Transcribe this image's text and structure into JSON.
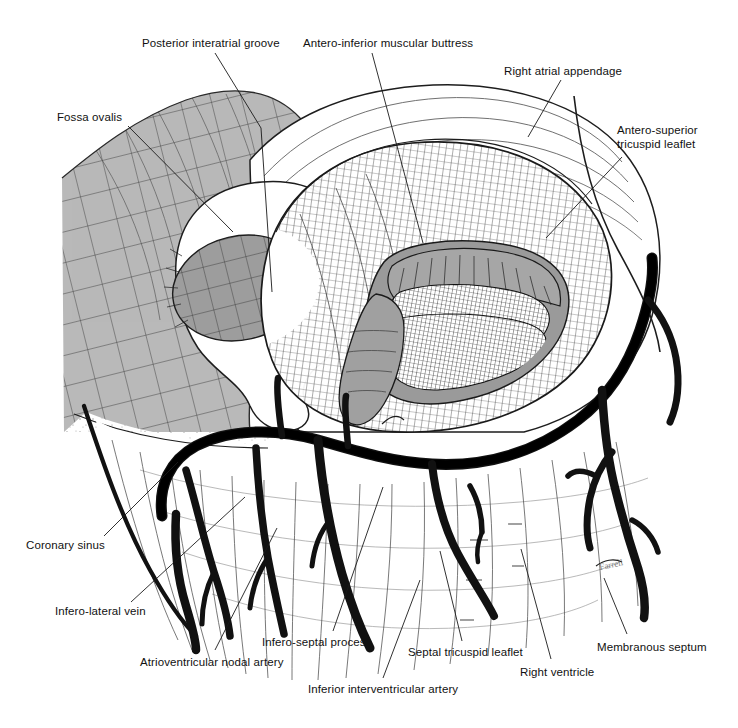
{
  "figure": {
    "width": 738,
    "height": 728,
    "background_color": "#ffffff",
    "ink_color": "#111111",
    "shaded_tone": "#b9b9b9",
    "mid_tone": "#a5a5a5",
    "vessel_color": "#111111",
    "signature": "Farrell"
  },
  "labels": [
    {
      "id": "fossa-ovalis",
      "text": "Fossa ovalis",
      "x": 57,
      "y": 110,
      "leader": [
        [
          128,
          126
        ],
        [
          233,
          232
        ]
      ]
    },
    {
      "id": "posterior-interatrial-groove",
      "text": "Posterior interatrial groove",
      "x": 142,
      "y": 36,
      "leader": [
        [
          215,
          53
        ],
        [
          261,
          128
        ],
        [
          272,
          292
        ]
      ]
    },
    {
      "id": "antero-inferior-muscular-buttress",
      "text": "Antero-inferior muscular buttress",
      "x": 303,
      "y": 36,
      "leader": [
        [
          372,
          53
        ],
        [
          423,
          243
        ]
      ]
    },
    {
      "id": "right-atrial-appendage",
      "text": "Right atrial appendage",
      "x": 504,
      "y": 64,
      "leader": [
        [
          561,
          80
        ],
        [
          528,
          137
        ]
      ]
    },
    {
      "id": "antero-superior-tricuspid-leaflet",
      "text": "Antero-superior\ntricuspid leaflet",
      "x": 617,
      "y": 123,
      "leader": [
        [
          622,
          157
        ],
        [
          546,
          238
        ]
      ]
    },
    {
      "id": "coronary-sinus",
      "text": "Coronary sinus",
      "x": 26,
      "y": 538,
      "leader": [
        [
          104,
          536
        ],
        [
          178,
          462
        ]
      ]
    },
    {
      "id": "infero-lateral-vein",
      "text": "Infero-lateral vein",
      "x": 55,
      "y": 604,
      "leader": [
        [
          131,
          602
        ],
        [
          245,
          497
        ]
      ]
    },
    {
      "id": "atrioventricular-nodal-artery",
      "text": "Atrioventricular nodal artery",
      "x": 140,
      "y": 655,
      "leader": [
        [
          215,
          650
        ],
        [
          277,
          528
        ]
      ]
    },
    {
      "id": "infero-septal-process",
      "text": "Infero-septal process",
      "x": 262,
      "y": 635,
      "leader": [
        [
          333,
          631
        ],
        [
          383,
          487
        ]
      ]
    },
    {
      "id": "inferior-interventricular-artery",
      "text": "Inferior interventricular artery",
      "x": 308,
      "y": 682,
      "leader": [
        [
          383,
          678
        ],
        [
          420,
          580
        ]
      ]
    },
    {
      "id": "septal-tricuspid-leaflet",
      "text": "Septal tricuspid leaflet",
      "x": 408,
      "y": 645,
      "leader": [
        [
          462,
          641
        ],
        [
          440,
          551
        ]
      ]
    },
    {
      "id": "right-ventricle",
      "text": "Right ventricle",
      "x": 520,
      "y": 665,
      "leader": [
        [
          551,
          659
        ],
        [
          521,
          549
        ]
      ]
    },
    {
      "id": "membranous-septum",
      "text": "Membranous septum",
      "x": 597,
      "y": 640,
      "leader": [
        [
          627,
          634
        ],
        [
          604,
          578
        ]
      ]
    }
  ],
  "regions": [
    {
      "id": "posterior-atrial-wall-shaded",
      "name": "Posterior atrial wall (shaded)",
      "tone": "#b9b9b9"
    },
    {
      "id": "fossa-ovalis-floor",
      "name": "Fossa ovalis floor",
      "tone": "#9d9d9d"
    },
    {
      "id": "atrial-vestibule-crosshatch",
      "name": "Atrial vestibule crosshatch",
      "tone": "#ffffff"
    },
    {
      "id": "tricuspid-orifice",
      "name": "Tricuspid valve orifice",
      "tone": "#8f8f8f"
    },
    {
      "id": "antero-superior-leaflet-body",
      "name": "Antero-superior leaflet",
      "tone": "#9a9a9a"
    },
    {
      "id": "right-ventricle-wall",
      "name": "Right ventricular wall",
      "tone": "#ffffff"
    }
  ],
  "vessels": [
    {
      "id": "right-coronary-artery",
      "name": "Right coronary artery trunk"
    },
    {
      "id": "inferior-interventricular-artery",
      "name": "Inferior interventricular artery"
    },
    {
      "id": "atrioventricular-nodal-artery",
      "name": "Atrioventricular nodal artery"
    },
    {
      "id": "infero-lateral-vein",
      "name": "Infero-lateral vein"
    },
    {
      "id": "coronary-sinus",
      "name": "Coronary sinus"
    }
  ]
}
